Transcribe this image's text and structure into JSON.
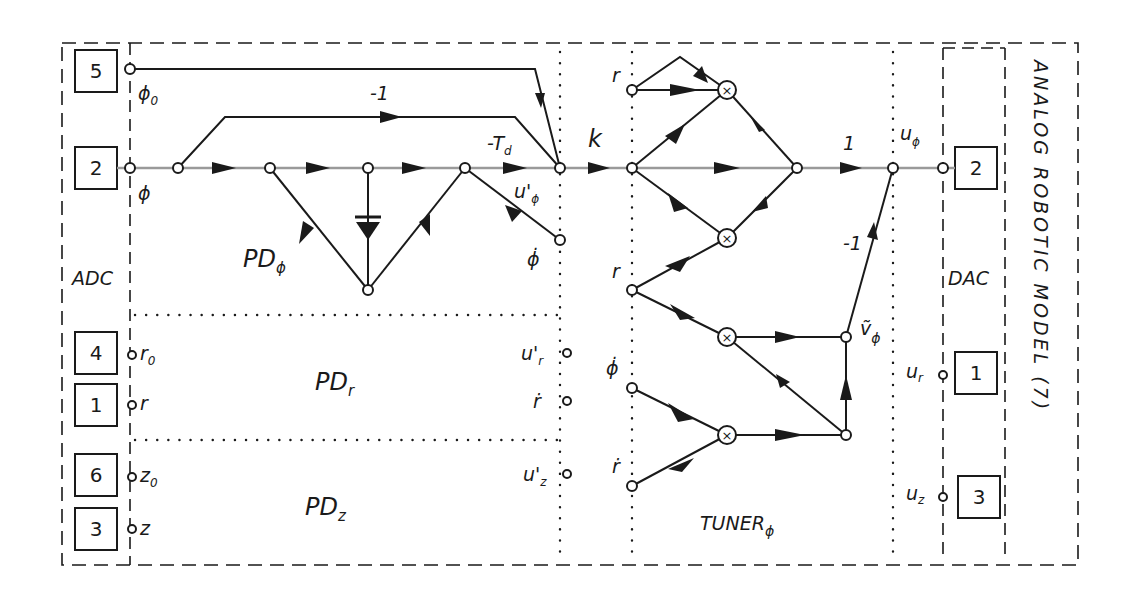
{
  "diagram": {
    "title": "ANALOG ROBOTIC MODEL (7)",
    "sections": {
      "adc": "ADC",
      "dac": "DAC",
      "pd_phi": {
        "main": "PD",
        "sub": "ϕ"
      },
      "pd_r": {
        "main": "PD",
        "sub": "r"
      },
      "pd_z": {
        "main": "PD",
        "sub": "z"
      },
      "tuner": {
        "main": "TUNER",
        "sub": "ϕ"
      }
    },
    "adc_ports": [
      {
        "id": "5",
        "signal": "ϕ",
        "signal_sub": "0"
      },
      {
        "id": "2",
        "signal": "ϕ",
        "signal_sub": ""
      },
      {
        "id": "4",
        "signal": "r",
        "signal_sub": "0"
      },
      {
        "id": "1",
        "signal": "r",
        "signal_sub": ""
      },
      {
        "id": "6",
        "signal": "z",
        "signal_sub": "0"
      },
      {
        "id": "3",
        "signal": "z",
        "signal_sub": ""
      }
    ],
    "dac_ports": [
      {
        "id": "2",
        "signal": "u",
        "signal_sub": "ϕ"
      },
      {
        "id": "1",
        "signal": "u",
        "signal_sub": "r"
      },
      {
        "id": "3",
        "signal": "u",
        "signal_sub": "z"
      }
    ],
    "gains": {
      "feedback_minus_one": "-1",
      "neg_td": "-T",
      "neg_td_sub": "d",
      "k": "k",
      "one": "1",
      "tuner_minus_one": "-1"
    },
    "pd_outputs": {
      "u_phi": {
        "main": "u'",
        "sub": "ϕ"
      },
      "phi_dot": "ϕ̇",
      "u_r": {
        "main": "u'",
        "sub": "r"
      },
      "r_dot": "ṙ",
      "u_z": {
        "main": "u'",
        "sub": "z"
      }
    },
    "tuner_inputs": {
      "r_top": "r",
      "r_mid": "r",
      "phi_dot": "ϕ̇",
      "r_dot": "ṙ"
    },
    "tuner_signal": {
      "main": "ṽ",
      "sub": "ϕ"
    },
    "multiplier_symbol": "×",
    "colors": {
      "ink": "#1a1a1a",
      "main_path": "#9a9a9a",
      "background": "#ffffff"
    }
  }
}
